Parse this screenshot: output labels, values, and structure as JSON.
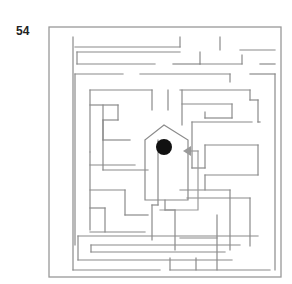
{
  "puzzle": {
    "number": "54",
    "type": "maze",
    "wall_color": "#8a8a8a",
    "goal_color": "#111111",
    "arrow_color": "#9a9a9a"
  },
  "maze": {
    "outer_frame": [
      49,
      27,
      281,
      277
    ],
    "inner_frame": [
      55,
      37,
      275,
      271
    ],
    "walls": [
      [
        [
          73,
          37
        ],
        [
          73,
          270
        ]
      ],
      [
        [
          73,
          270
        ],
        [
          160,
          270
        ]
      ],
      [
        [
          170,
          270
        ],
        [
          270,
          270
        ]
      ],
      [
        [
          75,
          47
        ],
        [
          180,
          47
        ]
      ],
      [
        [
          180,
          47
        ],
        [
          180,
          37
        ]
      ],
      [
        [
          220,
          37
        ],
        [
          220,
          50
        ]
      ],
      [
        [
          240,
          50
        ],
        [
          275,
          50
        ]
      ],
      [
        [
          77,
          52
        ],
        [
          180,
          52
        ]
      ],
      [
        [
          77,
          52
        ],
        [
          77,
          64
        ]
      ],
      [
        [
          77,
          64
        ],
        [
          155,
          64
        ]
      ],
      [
        [
          173,
          64
        ],
        [
          200,
          64
        ]
      ],
      [
        [
          200,
          64
        ],
        [
          200,
          52
        ]
      ],
      [
        [
          200,
          64
        ],
        [
          242,
          64
        ]
      ],
      [
        [
          242,
          64
        ],
        [
          242,
          55
        ]
      ],
      [
        [
          260,
          64
        ],
        [
          275,
          64
        ]
      ],
      [
        [
          75,
          74
        ],
        [
          123,
          74
        ]
      ],
      [
        [
          140,
          74
        ],
        [
          230,
          74
        ]
      ],
      [
        [
          230,
          74
        ],
        [
          230,
          82
        ]
      ],
      [
        [
          250,
          74
        ],
        [
          275,
          74
        ]
      ],
      [
        [
          275,
          74
        ],
        [
          275,
          270
        ]
      ],
      [
        [
          75,
          74
        ],
        [
          75,
          245
        ]
      ],
      [
        [
          90,
          90
        ],
        [
          152,
          90
        ]
      ],
      [
        [
          152,
          90
        ],
        [
          152,
          110
        ]
      ],
      [
        [
          168,
          90
        ],
        [
          168,
          110
        ]
      ],
      [
        [
          180,
          90
        ],
        [
          250,
          90
        ]
      ],
      [
        [
          250,
          90
        ],
        [
          250,
          100
        ]
      ],
      [
        [
          250,
          100
        ],
        [
          258,
          100
        ]
      ],
      [
        [
          258,
          100
        ],
        [
          258,
          122
        ]
      ],
      [
        [
          258,
          122
        ],
        [
          260,
          122
        ]
      ],
      [
        [
          90,
          90
        ],
        [
          90,
          152
        ]
      ],
      [
        [
          90,
          152
        ],
        [
          90,
          230
        ]
      ],
      [
        [
          90,
          105
        ],
        [
          118,
          105
        ]
      ],
      [
        [
          118,
          105
        ],
        [
          118,
          120
        ]
      ],
      [
        [
          118,
          120
        ],
        [
          103,
          120
        ]
      ],
      [
        [
          103,
          120
        ],
        [
          103,
          140
        ]
      ],
      [
        [
          103,
          140
        ],
        [
          130,
          140
        ]
      ],
      [
        [
          103,
          105
        ],
        [
          103,
          170
        ]
      ],
      [
        [
          103,
          170
        ],
        [
          148,
          170
        ]
      ],
      [
        [
          90,
          165
        ],
        [
          135,
          165
        ]
      ],
      [
        [
          90,
          190
        ],
        [
          125,
          190
        ]
      ],
      [
        [
          125,
          190
        ],
        [
          125,
          215
        ]
      ],
      [
        [
          125,
          215
        ],
        [
          148,
          215
        ]
      ],
      [
        [
          90,
          208
        ],
        [
          105,
          208
        ]
      ],
      [
        [
          105,
          208
        ],
        [
          105,
          232
        ]
      ],
      [
        [
          90,
          232
        ],
        [
          145,
          232
        ]
      ],
      [
        [
          78,
          236
        ],
        [
          258,
          236
        ]
      ],
      [
        [
          78,
          236
        ],
        [
          78,
          260
        ]
      ],
      [
        [
          78,
          260
        ],
        [
          232,
          260
        ]
      ],
      [
        [
          91,
          245
        ],
        [
          240,
          245
        ]
      ],
      [
        [
          91,
          245
        ],
        [
          91,
          252
        ]
      ],
      [
        [
          91,
          252
        ],
        [
          225,
          252
        ]
      ],
      [
        [
          182,
          90
        ],
        [
          182,
          125
        ]
      ],
      [
        [
          182,
          104
        ],
        [
          232,
          104
        ]
      ],
      [
        [
          232,
          104
        ],
        [
          232,
          118
        ]
      ],
      [
        [
          232,
          118
        ],
        [
          205,
          118
        ]
      ],
      [
        [
          205,
          112
        ],
        [
          205,
          118
        ]
      ],
      [
        [
          192,
          122
        ],
        [
          252,
          122
        ]
      ],
      [
        [
          192,
          122
        ],
        [
          192,
          168
        ]
      ],
      [
        [
          192,
          168
        ],
        [
          205,
          168
        ]
      ],
      [
        [
          205,
          168
        ],
        [
          205,
          145
        ]
      ],
      [
        [
          205,
          145
        ],
        [
          258,
          145
        ]
      ],
      [
        [
          258,
          145
        ],
        [
          258,
          175
        ]
      ],
      [
        [
          205,
          175
        ],
        [
          258,
          175
        ]
      ],
      [
        [
          205,
          175
        ],
        [
          205,
          190
        ]
      ],
      [
        [
          180,
          190
        ],
        [
          230,
          190
        ]
      ],
      [
        [
          230,
          190
        ],
        [
          230,
          250
        ]
      ],
      [
        [
          187,
          198
        ],
        [
          250,
          198
        ]
      ],
      [
        [
          250,
          198
        ],
        [
          250,
          246
        ]
      ],
      [
        [
          165,
          200
        ],
        [
          165,
          210
        ]
      ],
      [
        [
          165,
          210
        ],
        [
          175,
          210
        ]
      ],
      [
        [
          175,
          210
        ],
        [
          175,
          250
        ]
      ],
      [
        [
          217,
          215
        ],
        [
          217,
          270
        ]
      ],
      [
        [
          180,
          238
        ],
        [
          217,
          238
        ]
      ],
      [
        [
          158,
          140
        ],
        [
          158,
          205
        ]
      ],
      [
        [
          158,
          205
        ],
        [
          152,
          205
        ]
      ],
      [
        [
          152,
          205
        ],
        [
          152,
          240
        ]
      ],
      [
        [
          170,
          258
        ],
        [
          170,
          270
        ]
      ],
      [
        [
          196,
          258
        ],
        [
          196,
          270
        ]
      ]
    ],
    "house": {
      "points": [
        [
          145,
          140
        ],
        [
          164,
          125
        ],
        [
          188,
          140
        ],
        [
          188,
          200
        ],
        [
          145,
          200
        ],
        [
          145,
          140
        ]
      ],
      "goal_circle": {
        "cx": 164,
        "cy": 147,
        "r": 8
      },
      "arrow": {
        "tip": [
          183,
          151
        ],
        "tail": [
          198,
          151
        ]
      }
    },
    "entrance_path": [
      [
        198,
        151
      ],
      [
        198,
        210
      ],
      [
        160,
        210
      ]
    ]
  }
}
